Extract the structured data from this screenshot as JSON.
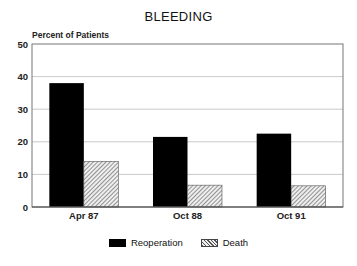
{
  "chart_data": {
    "type": "bar",
    "title": "BLEEDING",
    "xlabel": "",
    "ylabel": "Percent of Patients",
    "ylim": [
      0,
      50
    ],
    "yticks": [
      0,
      10,
      20,
      30,
      40,
      50
    ],
    "grid": true,
    "legend_position": "bottom",
    "categories": [
      "Apr 87",
      "Oct 88",
      "Oct 91"
    ],
    "series": [
      {
        "name": "Reoperation",
        "color": "#000000",
        "pattern": "solid",
        "values": [
          38,
          21.5,
          22.5
        ]
      },
      {
        "name": "Death",
        "color": "#888888",
        "pattern": "hatched",
        "values": [
          14,
          6.7,
          6.5
        ]
      }
    ]
  }
}
